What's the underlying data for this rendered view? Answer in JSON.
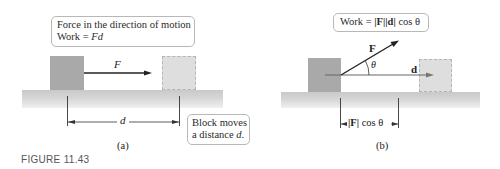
{
  "figure": {
    "label": "FIGURE 11.43"
  },
  "panel_a": {
    "caption": "(a)",
    "callout_top": {
      "line1": "Force in the direction of motion",
      "line2_prefix": "Work = ",
      "line2_math": "Fd"
    },
    "force_label": "F",
    "distance_label": "d",
    "callout_bottom": {
      "line1": "Block moves",
      "line2_prefix": "a distance ",
      "line2_math": "d",
      "line2_suffix": "."
    }
  },
  "panel_b": {
    "caption": "(b)",
    "callout_top": {
      "prefix": "Work = ",
      "abs_F": "|F|",
      "abs_d": "|d|",
      "suffix": " cos θ"
    },
    "force_label": "F",
    "angle_label": "θ",
    "displacement_label": "d",
    "projection_label": {
      "abs_F": "|F|",
      "suffix": " cos θ"
    }
  },
  "colors": {
    "block": "#a9a9a9",
    "ghost_block": "#dedede",
    "ground_top": "#c9c9c9",
    "ground_bottom": "#f0f0f0",
    "arrow": "#222222",
    "d_arrow": "#777777"
  }
}
